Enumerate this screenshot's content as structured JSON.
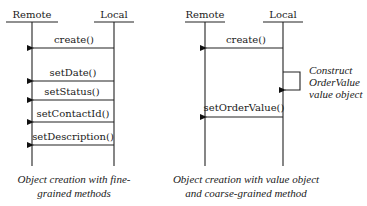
{
  "left_diagram": {
    "remote_label": "Remote",
    "local_label": "Local",
    "messages": [
      {
        "label": "create()",
        "y": 48
      },
      {
        "label": "setDate()",
        "y": 81
      },
      {
        "label": "setStatus()",
        "y": 100
      },
      {
        "label": "setContactId()",
        "y": 122
      },
      {
        "label": "setDescription()",
        "y": 145
      }
    ],
    "caption_line1": "Object creation with fine-",
    "caption_line2": "grained methods"
  },
  "right_diagram": {
    "remote_label": "Remote",
    "local_label": "Local",
    "messages": [
      {
        "label": "create()",
        "y": 48
      },
      {
        "label": "setOrderValue()",
        "y": 117
      }
    ],
    "self_call_note": {
      "line1": "Construct",
      "line2": "OrderValue",
      "line3": "value object"
    },
    "caption_line1": "Object creation with value object",
    "caption_line2": "and coarse-grained method"
  }
}
